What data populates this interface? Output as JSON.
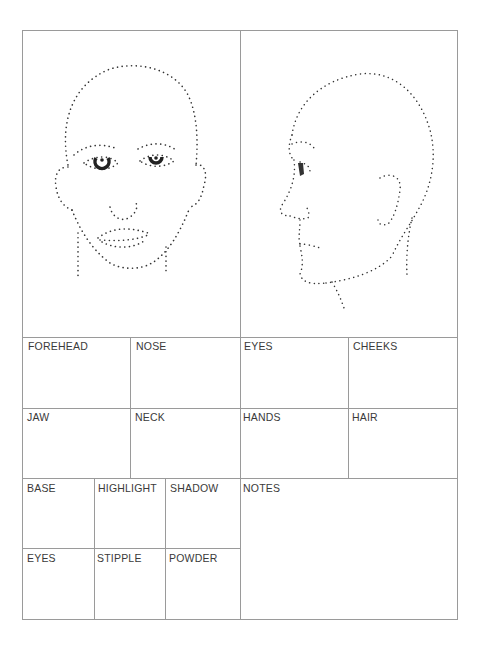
{
  "form": {
    "title": "Makeup face chart",
    "illustrations": {
      "front": "front-face-outline",
      "profile": "profile-face-outline"
    },
    "face_areas": {
      "forehead": "FOREHEAD",
      "nose": "NOSE",
      "eyes": "EYES",
      "cheeks": "CHEEKS",
      "jaw": "JAW",
      "neck": "NECK",
      "hands": "HANDS",
      "hair": "HAIR"
    },
    "products": {
      "base": "BASE",
      "highlight": "HIGHLIGHT",
      "shadow": "SHADOW",
      "eyes": "EYES",
      "stipple": "STIPPLE",
      "powder": "POWDER"
    },
    "notes": "NOTES"
  },
  "colors": {
    "border": "#9a9a9a",
    "text": "#3a3a3a",
    "dots": "#333333"
  }
}
